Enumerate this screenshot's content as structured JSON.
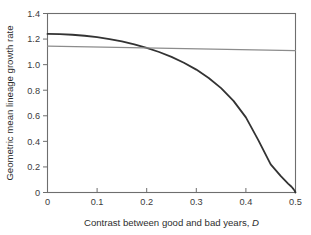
{
  "chart_data": {
    "type": "line",
    "title": "",
    "xlabel": "Contrast between good and bad years, D",
    "xlabel_text": "Contrast between good and bad years,",
    "xlabel_symbol": "D",
    "ylabel": "Geometric mean lineage growth rate",
    "xlim": [
      0,
      0.5
    ],
    "ylim": [
      0,
      1.4
    ],
    "xticks": [
      0,
      0.1,
      0.2,
      0.3,
      0.4,
      0.5
    ],
    "xtick_labels": [
      "0",
      "0.1",
      "0.2",
      "0.3",
      "0.4",
      "0.5"
    ],
    "yticks": [
      0,
      0.2,
      0.4,
      0.6,
      0.8,
      1.0,
      1.2,
      1.4
    ],
    "ytick_labels": [
      "0",
      "0.2",
      "0.4",
      "0.6",
      "0.8",
      "1.0",
      "1.2",
      "1.4"
    ],
    "grid": false,
    "legend": "none",
    "frame": "box",
    "series": [
      {
        "name": "geometric-mean-curve",
        "color": "#333333",
        "width": 1.8,
        "x": [
          0,
          0.025,
          0.05,
          0.075,
          0.1,
          0.125,
          0.15,
          0.175,
          0.2,
          0.225,
          0.25,
          0.275,
          0.3,
          0.325,
          0.35,
          0.375,
          0.4,
          0.425,
          0.45,
          0.47,
          0.485,
          0.492,
          0.496,
          0.498,
          0.5
        ],
        "y": [
          1.24,
          1.2385,
          1.2338,
          1.2259,
          1.2146,
          1.1998,
          1.1813,
          1.1586,
          1.1314,
          1.099,
          1.0606,
          1.0152,
          0.9611,
          0.896,
          0.8165,
          0.7169,
          0.5876,
          0.41,
          0.22,
          0.13,
          0.07,
          0.045,
          0.026,
          0.016,
          0.0
        ]
      },
      {
        "name": "arithmetic-mean-line",
        "color": "#8c8c8c",
        "width": 1.2,
        "x": [
          0,
          0.5
        ],
        "y": [
          1.145,
          1.11
        ]
      }
    ],
    "annotations": []
  },
  "figure": {
    "background": "#ffffff",
    "axis_color": "#6e6e6e",
    "text_color": "#2e2e2e"
  }
}
